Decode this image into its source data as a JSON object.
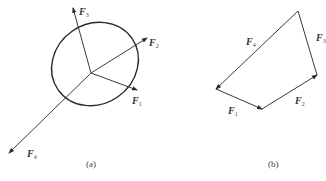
{
  "figure_a": {
    "caption": "(a)",
    "forces": [
      {
        "name": "F",
        "sub": "1"
      },
      {
        "name": "F",
        "sub": "2"
      },
      {
        "name": "F",
        "sub": "3"
      },
      {
        "name": "F",
        "sub": "4"
      }
    ]
  },
  "figure_b": {
    "caption": "(b)",
    "forces": [
      {
        "name": "F",
        "sub": "1"
      },
      {
        "name": "F",
        "sub": "2"
      },
      {
        "name": "F",
        "sub": "3"
      },
      {
        "name": "F",
        "sub": "4"
      }
    ]
  },
  "colors": {
    "line": "#3a3a3a",
    "background": "#ffffff"
  }
}
